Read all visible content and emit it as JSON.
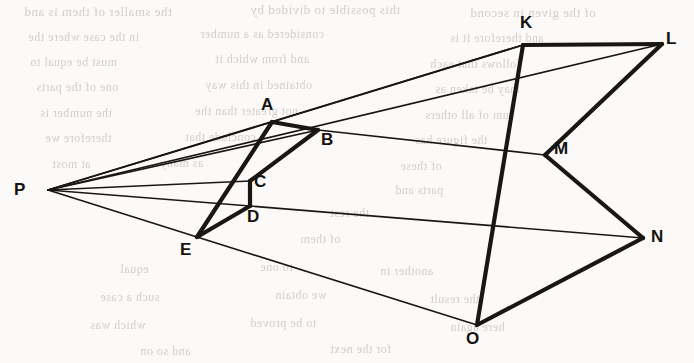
{
  "figure": {
    "canvas": {
      "width": 694,
      "height": 363
    },
    "stroke_color": "#1a1713",
    "background_color": "#fbfaf8",
    "thick_width": 4.2,
    "thin_width": 1.7,
    "vertices": [
      {
        "id": "P",
        "label": "P",
        "x": 48,
        "y": 190,
        "label_x": 14,
        "label_y": 181
      },
      {
        "id": "A",
        "label": "A",
        "x": 272,
        "y": 122,
        "label_x": 261,
        "label_y": 96
      },
      {
        "id": "B",
        "label": "B",
        "x": 318,
        "y": 130,
        "label_x": 321,
        "label_y": 131
      },
      {
        "id": "C",
        "label": "C",
        "x": 250,
        "y": 181,
        "label_x": 254,
        "label_y": 173
      },
      {
        "id": "D",
        "label": "D",
        "x": 250,
        "y": 206,
        "label_x": 247,
        "label_y": 208
      },
      {
        "id": "E",
        "label": "E",
        "x": 197,
        "y": 237,
        "label_x": 180,
        "label_y": 241
      },
      {
        "id": "K",
        "label": "K",
        "x": 523,
        "y": 45,
        "label_x": 520,
        "label_y": 14
      },
      {
        "id": "L",
        "label": "L",
        "x": 662,
        "y": 44,
        "label_x": 666,
        "label_y": 30
      },
      {
        "id": "M",
        "label": "M",
        "x": 545,
        "y": 155,
        "label_x": 554,
        "label_y": 140
      },
      {
        "id": "N",
        "label": "N",
        "x": 643,
        "y": 238,
        "label_x": 651,
        "label_y": 228
      },
      {
        "id": "O",
        "label": "O",
        "x": 477,
        "y": 325,
        "label_x": 466,
        "label_y": 330
      }
    ],
    "thick_edges": [
      {
        "from": "A",
        "to": "B",
        "name": "edge-ab"
      },
      {
        "from": "B",
        "to": "C",
        "name": "edge-bc"
      },
      {
        "from": "C",
        "to": "D",
        "name": "edge-cd"
      },
      {
        "from": "D",
        "to": "E",
        "name": "edge-de"
      },
      {
        "from": "E",
        "to": "A",
        "name": "edge-ea"
      },
      {
        "from": "K",
        "to": "L",
        "name": "edge-kl"
      },
      {
        "from": "L",
        "to": "M",
        "name": "edge-lm"
      },
      {
        "from": "M",
        "to": "N",
        "name": "edge-mn"
      },
      {
        "from": "N",
        "to": "O",
        "name": "edge-no"
      },
      {
        "from": "O",
        "to": "K",
        "name": "edge-ok"
      }
    ],
    "thin_edges": [
      {
        "from": "P",
        "to": "K",
        "name": "ray-pk"
      },
      {
        "from": "P",
        "to": "L",
        "name": "ray-pl"
      },
      {
        "from": "P",
        "to": "A",
        "name": "ray-pa"
      },
      {
        "from": "A",
        "to": "K",
        "name": "ray-ak"
      },
      {
        "from": "B",
        "to": "M",
        "name": "ray-bm"
      },
      {
        "from": "P",
        "to": "B",
        "name": "ray-pb"
      },
      {
        "from": "P",
        "to": "C",
        "name": "ray-pc"
      },
      {
        "from": "P",
        "to": "D",
        "name": "ray-pd"
      },
      {
        "from": "D",
        "to": "N",
        "name": "ray-dn"
      },
      {
        "from": "P",
        "to": "E",
        "name": "ray-pe"
      },
      {
        "from": "E",
        "to": "O",
        "name": "ray-eo"
      }
    ]
  },
  "background_text": {
    "note": "faint illegible show-through text from the reverse side of the page",
    "lines": [
      {
        "text": "the smaller of them is and",
        "x": 24,
        "y": 4,
        "size": 13
      },
      {
        "text": "this possible to divided by",
        "x": 250,
        "y": 2,
        "size": 13
      },
      {
        "text": "of the given in second",
        "x": 470,
        "y": 5,
        "size": 13
      },
      {
        "text": "in the case where the",
        "x": 28,
        "y": 30,
        "size": 12
      },
      {
        "text": "considered as a number",
        "x": 200,
        "y": 27,
        "size": 12
      },
      {
        "text": "and therefore it is",
        "x": 450,
        "y": 31,
        "size": 12
      },
      {
        "text": "must be equal to",
        "x": 30,
        "y": 55,
        "size": 12
      },
      {
        "text": "and from which it",
        "x": 215,
        "y": 52,
        "size": 12
      },
      {
        "text": "follows that each",
        "x": 430,
        "y": 57,
        "size": 12
      },
      {
        "text": "one of the parts",
        "x": 36,
        "y": 80,
        "size": 12
      },
      {
        "text": "obtained in this way",
        "x": 205,
        "y": 78,
        "size": 12
      },
      {
        "text": "may be taken as",
        "x": 435,
        "y": 82,
        "size": 12
      },
      {
        "text": "the number is",
        "x": 40,
        "y": 106,
        "size": 12
      },
      {
        "text": "not greater than the",
        "x": 195,
        "y": 104,
        "size": 12
      },
      {
        "text": "sum of all others",
        "x": 425,
        "y": 108,
        "size": 12
      },
      {
        "text": "therefore we",
        "x": 45,
        "y": 131,
        "size": 12
      },
      {
        "text": "conclude that",
        "x": 185,
        "y": 130,
        "size": 12
      },
      {
        "text": "the figure has",
        "x": 415,
        "y": 133,
        "size": 12
      },
      {
        "text": "at most",
        "x": 52,
        "y": 157,
        "size": 12
      },
      {
        "text": "as many",
        "x": 160,
        "y": 156,
        "size": 12
      },
      {
        "text": "of these",
        "x": 400,
        "y": 159,
        "size": 12
      },
      {
        "text": "parts and",
        "x": 395,
        "y": 183,
        "size": 12
      },
      {
        "text": "the rest",
        "x": 330,
        "y": 206,
        "size": 12
      },
      {
        "text": "of them",
        "x": 300,
        "y": 232,
        "size": 12
      },
      {
        "text": "equal",
        "x": 120,
        "y": 262,
        "size": 12
      },
      {
        "text": "to one",
        "x": 260,
        "y": 260,
        "size": 12
      },
      {
        "text": "another in",
        "x": 380,
        "y": 264,
        "size": 12
      },
      {
        "text": "such a case",
        "x": 100,
        "y": 290,
        "size": 12
      },
      {
        "text": "we obtain",
        "x": 275,
        "y": 288,
        "size": 12
      },
      {
        "text": "the result",
        "x": 430,
        "y": 292,
        "size": 12
      },
      {
        "text": "which was",
        "x": 90,
        "y": 318,
        "size": 12
      },
      {
        "text": "to be proved",
        "x": 250,
        "y": 316,
        "size": 12
      },
      {
        "text": "here again",
        "x": 450,
        "y": 320,
        "size": 12
      },
      {
        "text": "and so on",
        "x": 140,
        "y": 344,
        "size": 12
      },
      {
        "text": "for the next",
        "x": 330,
        "y": 342,
        "size": 12
      }
    ]
  }
}
